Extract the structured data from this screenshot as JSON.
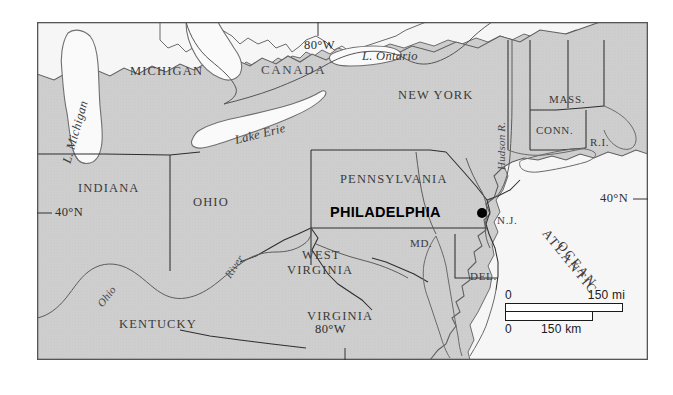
{
  "map": {
    "title": "Philadelphia location map — Northeastern United States",
    "frame": {
      "x": 37,
      "y": 22,
      "width": 611,
      "height": 338
    },
    "colors": {
      "page_background": "#ffffff",
      "land_fill": "#cdcdcd",
      "water_fill": "#f4f4f4",
      "frame_stroke": "#555555",
      "state_border": "#333333",
      "coast_stroke": "#5a5a5a",
      "river_stroke": "#555555",
      "city_marker": "#000000",
      "label_text": "#3a3a3a"
    },
    "city": {
      "name": "PHILADELPHIA",
      "marker_x": 482,
      "marker_y": 213
    },
    "states": [
      {
        "name": "MICHIGAN",
        "x": 130,
        "y": 72
      },
      {
        "name": "INDIANA",
        "x": 78,
        "y": 189
      },
      {
        "name": "OHIO",
        "x": 193,
        "y": 203
      },
      {
        "name": "KENTUCKY",
        "x": 119,
        "y": 325
      },
      {
        "name": "PENNSYLVANIA",
        "x": 340,
        "y": 180
      },
      {
        "name": "NEW YORK",
        "x": 398,
        "y": 96
      },
      {
        "name": "WEST",
        "x": 302,
        "y": 256
      },
      {
        "name": "VIRGINIA",
        "x": 294,
        "y": 271
      },
      {
        "name": "VIRGINIA",
        "x": 307,
        "y": 317
      },
      {
        "name": "MASS.",
        "x": 549,
        "y": 100
      },
      {
        "name": "CONN.",
        "x": 540,
        "y": 131
      },
      {
        "name": "R.I.",
        "x": 593,
        "y": 143
      },
      {
        "name": "N.J.",
        "x": 497,
        "y": 221
      },
      {
        "name": "MD.",
        "x": 413,
        "y": 244
      },
      {
        "name": "DEL.",
        "x": 473,
        "y": 277
      }
    ],
    "countries": [
      {
        "name": "CANADA",
        "x": 261,
        "y": 71
      }
    ],
    "water_labels": [
      {
        "name": "L. Michigan",
        "x": 74,
        "y": 150,
        "rotation": -74
      },
      {
        "name": "L. Ontario",
        "x": 365,
        "y": 57,
        "rotation": 0
      },
      {
        "name": "Lake Erie",
        "x": 237,
        "y": 133,
        "rotation": -14
      },
      {
        "name": "Hudson R.",
        "x": 509,
        "y": 158,
        "rotation": -90
      },
      {
        "name": "Ohio",
        "x": 104,
        "y": 297,
        "rotation": -52
      },
      {
        "name": "River",
        "x": 232,
        "y": 268,
        "rotation": -56
      }
    ],
    "ocean_label": {
      "line1": "ATLANTIC",
      "line2": "OCEAN",
      "x": 551,
      "y": 226,
      "rotation": 51
    },
    "coordinates": [
      {
        "label": "80°W",
        "x": 304,
        "y": 45,
        "position": "top"
      },
      {
        "label": "80°W",
        "x": 330,
        "y": 330,
        "position": "bottom"
      },
      {
        "label": "40°N",
        "x": 57,
        "y": 213,
        "position": "left"
      },
      {
        "label": "40°N",
        "x": 604,
        "y": 199,
        "position": "right"
      }
    ],
    "scale_bar": {
      "miles_zero": "0",
      "miles_max": "150 mi",
      "km_zero": "0",
      "km_max": "150 km"
    }
  }
}
